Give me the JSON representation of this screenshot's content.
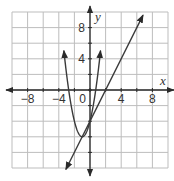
{
  "chart_data": {
    "type": "line",
    "title": "",
    "xlabel": "x",
    "ylabel": "y",
    "xlim": [
      -10,
      10
    ],
    "ylim": [
      -10,
      10
    ],
    "grid": true,
    "grid_step": 2,
    "x_ticks": [
      -8,
      -4,
      0,
      4,
      8
    ],
    "x_tick_labels": [
      "−8",
      "−4",
      "0",
      "4",
      "8"
    ],
    "y_ticks": [
      4,
      8
    ],
    "y_tick_labels": [
      "4",
      "8"
    ],
    "origin_label": "0",
    "series": [
      {
        "name": "parabola",
        "kind": "quadratic",
        "vertex": [
          -1,
          -6
        ],
        "points": [
          [
            -3.5,
            10
          ],
          [
            -3,
            2
          ],
          [
            -2,
            -4
          ],
          [
            -1,
            -6
          ],
          [
            0,
            -4
          ],
          [
            1,
            2
          ],
          [
            1.5,
            10
          ]
        ]
      },
      {
        "name": "line",
        "kind": "linear",
        "points": [
          [
            -4,
            -12
          ],
          [
            0,
            -4
          ],
          [
            2,
            0
          ],
          [
            7,
            10
          ]
        ]
      }
    ],
    "intersections": [
      [
        -1,
        -6
      ],
      [
        0,
        -4
      ]
    ]
  },
  "colors": {
    "grid": "#bdbdbd",
    "axis": "#2a2a2a",
    "curve": "#3a3a3a",
    "background": "#ffffff"
  }
}
